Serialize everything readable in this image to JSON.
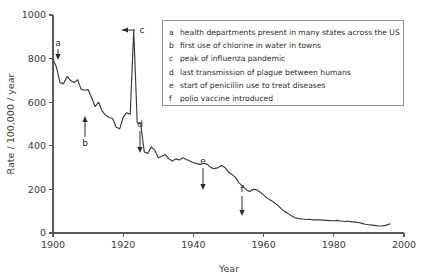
{
  "chart_data": {
    "type": "line",
    "title": "",
    "xlabel": "Year",
    "ylabel": "Rate / 100,000 / year",
    "xlim": [
      1900,
      2000
    ],
    "ylim": [
      0,
      1000
    ],
    "xticks": [
      1900,
      1920,
      1940,
      1960,
      1980,
      2000
    ],
    "yticks": [
      0,
      200,
      400,
      600,
      800,
      1000
    ],
    "grid": false,
    "legend_position": "upper-right-inset",
    "series": [
      {
        "name": "Infectious disease mortality rate",
        "x": [
          1900,
          1901,
          1902,
          1903,
          1904,
          1905,
          1906,
          1907,
          1908,
          1909,
          1910,
          1911,
          1912,
          1913,
          1914,
          1915,
          1916,
          1917,
          1918,
          1919,
          1920,
          1921,
          1922,
          1923,
          1924,
          1925,
          1926,
          1927,
          1928,
          1929,
          1930,
          1931,
          1932,
          1933,
          1934,
          1935,
          1936,
          1937,
          1938,
          1939,
          1940,
          1941,
          1942,
          1943,
          1944,
          1945,
          1946,
          1947,
          1948,
          1949,
          1950,
          1951,
          1952,
          1953,
          1954,
          1955,
          1956,
          1957,
          1958,
          1959,
          1960,
          1961,
          1962,
          1963,
          1964,
          1965,
          1966,
          1967,
          1968,
          1969,
          1970,
          1971,
          1972,
          1973,
          1974,
          1975,
          1976,
          1977,
          1978,
          1979,
          1980,
          1981,
          1982,
          1983,
          1984,
          1985,
          1986,
          1987,
          1988,
          1989,
          1990,
          1991,
          1992,
          1993,
          1994,
          1995,
          1996
        ],
        "values": [
          797,
          760,
          690,
          685,
          718,
          700,
          690,
          703,
          660,
          655,
          658,
          620,
          580,
          600,
          560,
          540,
          530,
          525,
          485,
          478,
          530,
          552,
          545,
          930,
          505,
          500,
          372,
          365,
          395,
          380,
          345,
          352,
          360,
          340,
          330,
          340,
          335,
          345,
          337,
          330,
          322,
          318,
          315,
          320,
          315,
          300,
          295,
          300,
          310,
          300,
          280,
          268,
          255,
          230,
          215,
          200,
          190,
          200,
          198,
          188,
          175,
          160,
          150,
          140,
          128,
          112,
          98,
          90,
          78,
          70,
          66,
          64,
          62,
          63,
          60,
          61,
          60,
          59,
          58,
          57,
          56,
          58,
          55,
          53,
          54,
          52,
          50,
          48,
          44,
          40,
          38,
          36,
          34,
          32,
          33,
          36,
          42
        ]
      }
    ],
    "annotations": [
      {
        "key": "a",
        "year": 1900,
        "value": 797,
        "text": "health departments present in many states across the US",
        "label_x": 58,
        "label_y": 46,
        "arrow_x": 58,
        "arrow_y1": 49,
        "arrow_y2": 60,
        "direction": "down"
      },
      {
        "key": "b",
        "year": 1908,
        "value": 660,
        "text": "first use of chlorine in water in towns",
        "label_x": 85,
        "label_y": 146,
        "arrow_x": 85,
        "arrow_y1": 137,
        "arrow_y2": 116,
        "direction": "up"
      },
      {
        "key": "c",
        "year": 1918,
        "value": 930,
        "text": "peak of influenza pandemic",
        "label_x": 142,
        "label_y": 33,
        "arrow_x": 135,
        "arrow_y1": 30,
        "arrow_y2": 122,
        "direction": "left"
      },
      {
        "key": "d",
        "year": 1924,
        "value": 372,
        "text": "last transmission of plague between humans",
        "label_x": 140,
        "label_y": 127,
        "arrow_x": 140,
        "arrow_y1": 131,
        "arrow_y2": 153,
        "direction": "down"
      },
      {
        "key": "e",
        "year": 1942,
        "value": 190,
        "text": "start of penicillin use to treat diseases",
        "label_x": 203,
        "label_y": 164,
        "arrow_x": 203,
        "arrow_y1": 168,
        "arrow_y2": 190,
        "direction": "down"
      },
      {
        "key": "f",
        "year": 1953,
        "value": 100,
        "text": "polio vaccine introduced",
        "label_x": 242,
        "label_y": 192,
        "arrow_x": 242,
        "arrow_y1": 196,
        "arrow_y2": 216,
        "direction": "down"
      }
    ]
  },
  "legend": {
    "items": [
      {
        "key": "a",
        "text": "health departments present in many states across the US"
      },
      {
        "key": "b",
        "text": "first use of chlorine in water in towns"
      },
      {
        "key": "c",
        "text": "peak of influenza pandemic"
      },
      {
        "key": "d",
        "text": "last transmission of plague between humans"
      },
      {
        "key": "e",
        "text": "start of penicillin use to treat diseases"
      },
      {
        "key": "f",
        "text": "polio vaccine introduced"
      }
    ]
  },
  "colors": {
    "line": "#3a3a3a",
    "axis": "#555a5e",
    "legend_border": "#8d9296",
    "background": "#ffffff"
  }
}
